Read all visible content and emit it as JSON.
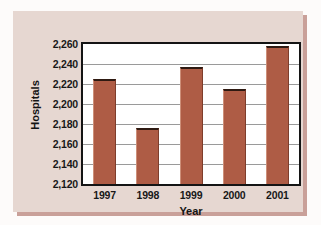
{
  "chart_data": {
    "type": "bar",
    "title": "",
    "xlabel": "Year",
    "ylabel": "Hospitals",
    "categories": [
      "1997",
      "1998",
      "1999",
      "2000",
      "2001"
    ],
    "values": [
      2225,
      2176,
      2237,
      2215,
      2258
    ],
    "ylim": [
      2120,
      2260
    ],
    "ytick_labels": [
      "2,260",
      "2,240",
      "2,220",
      "2,200",
      "2,180",
      "2,160",
      "2,140",
      "2,120"
    ],
    "ytick_values": [
      2260,
      2240,
      2220,
      2200,
      2180,
      2160,
      2140,
      2120
    ],
    "ytick_step": 20,
    "grid": true,
    "legend": false,
    "series": [
      {
        "name": "Hospitals",
        "values": [
          2225,
          2176,
          2237,
          2215,
          2258
        ]
      }
    ],
    "colors": {
      "bar_fill": "#ae5c45",
      "bar_top_edge": "#2e1a12",
      "plot_background": "#ffffff",
      "card_background": "#e6d7d1",
      "card_shadow": "#c9a099",
      "gridline": "#9a9a9a",
      "axis": "#141414",
      "text": "#181818"
    }
  }
}
